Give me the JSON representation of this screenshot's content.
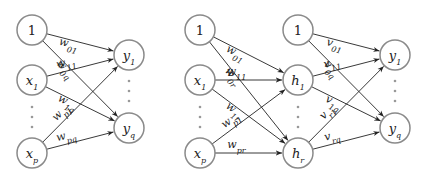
{
  "diagrams": [
    {
      "name": "single-layer",
      "nodes": [
        {
          "id": "b",
          "label": "1",
          "sub": "",
          "x": 32,
          "y": 30
        },
        {
          "id": "x1",
          "label": "x",
          "sub": "1",
          "x": 32,
          "y": 80
        },
        {
          "id": "xp",
          "label": "x",
          "sub": "p",
          "x": 32,
          "y": 153
        },
        {
          "id": "y1",
          "label": "y",
          "sub": "1",
          "x": 129,
          "y": 55
        },
        {
          "id": "yq",
          "label": "y",
          "sub": "q",
          "x": 129,
          "y": 128
        }
      ],
      "edges": [
        {
          "from": "b",
          "to": "y1",
          "label": "w",
          "sub": "01"
        },
        {
          "from": "b",
          "to": "yq",
          "label": "w",
          "sub": "0q"
        },
        {
          "from": "x1",
          "to": "y1",
          "label": "w",
          "sub": "11"
        },
        {
          "from": "x1",
          "to": "yq",
          "label": "w",
          "sub": "1q"
        },
        {
          "from": "xp",
          "to": "y1",
          "label": "w",
          "sub": "p1"
        },
        {
          "from": "xp",
          "to": "yq",
          "label": "w",
          "sub": "pq"
        }
      ]
    },
    {
      "name": "two-layer",
      "nodes": [
        {
          "id": "b",
          "label": "1",
          "sub": "",
          "x": 200,
          "y": 30
        },
        {
          "id": "x1",
          "label": "x",
          "sub": "1",
          "x": 200,
          "y": 80
        },
        {
          "id": "xp",
          "label": "x",
          "sub": "p",
          "x": 200,
          "y": 153
        },
        {
          "id": "b2",
          "label": "1",
          "sub": "",
          "x": 298,
          "y": 30
        },
        {
          "id": "h1",
          "label": "h",
          "sub": "1",
          "x": 298,
          "y": 80
        },
        {
          "id": "hr",
          "label": "h",
          "sub": "r",
          "x": 298,
          "y": 153
        },
        {
          "id": "y1",
          "label": "y",
          "sub": "1",
          "x": 395,
          "y": 55
        },
        {
          "id": "yq",
          "label": "y",
          "sub": "q",
          "x": 395,
          "y": 128
        }
      ],
      "edges": [
        {
          "from": "b",
          "to": "h1",
          "label": "w",
          "sub": "01"
        },
        {
          "from": "b",
          "to": "hr",
          "label": "w",
          "sub": "0r"
        },
        {
          "from": "x1",
          "to": "h1",
          "label": "w",
          "sub": "11"
        },
        {
          "from": "x1",
          "to": "hr",
          "label": "w",
          "sub": "1r"
        },
        {
          "from": "xp",
          "to": "h1",
          "label": "w",
          "sub": "p1"
        },
        {
          "from": "xp",
          "to": "hr",
          "label": "w",
          "sub": "pr"
        },
        {
          "from": "b2",
          "to": "y1",
          "label": "v",
          "sub": "01"
        },
        {
          "from": "b2",
          "to": "yq",
          "label": "v",
          "sub": "0q"
        },
        {
          "from": "h1",
          "to": "y1",
          "label": "v",
          "sub": "11"
        },
        {
          "from": "h1",
          "to": "yq",
          "label": "v",
          "sub": "1q"
        },
        {
          "from": "hr",
          "to": "y1",
          "label": "v",
          "sub": "r1"
        },
        {
          "from": "hr",
          "to": "yq",
          "label": "v",
          "sub": "rq"
        }
      ]
    }
  ]
}
